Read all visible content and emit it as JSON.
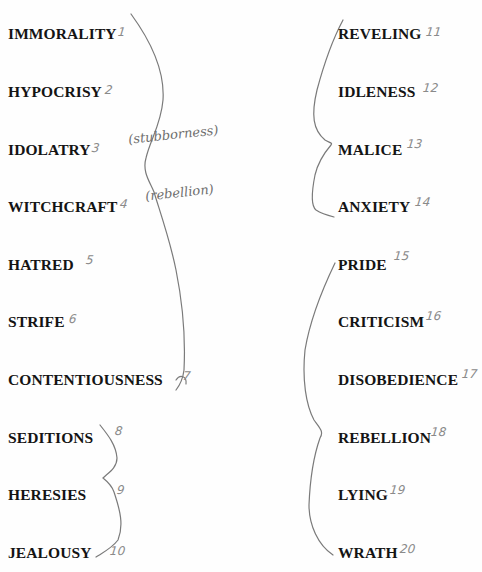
{
  "left_column": [
    {
      "word": "IMMORALITY",
      "number": "1"
    },
    {
      "word": "HYPOCRISY",
      "number": "2"
    },
    {
      "word": "IDOLATRY",
      "number": "3"
    },
    {
      "word": "WITCHCRAFT",
      "number": "4"
    },
    {
      "word": "HATRED",
      "number": "5"
    },
    {
      "word": "STRIFE",
      "number": "6"
    },
    {
      "word": "CONTENTIOUSNESS",
      "number": "7"
    },
    {
      "word": "SEDITIONS",
      "number": "8"
    },
    {
      "word": "HERESIES",
      "number": "9"
    },
    {
      "word": "JEALOUSY",
      "number": "10"
    }
  ],
  "right_column": [
    {
      "word": "REVELING",
      "number": "11"
    },
    {
      "word": "IDLENESS",
      "number": "12"
    },
    {
      "word": "MALICE",
      "number": "13"
    },
    {
      "word": "ANXIETY",
      "number": "14"
    },
    {
      "word": "PRIDE",
      "number": "15"
    },
    {
      "word": "CRITICISM",
      "number": "16"
    },
    {
      "word": "DISOBEDIENCE",
      "number": "17"
    },
    {
      "word": "REBELLION",
      "number": "18"
    },
    {
      "word": "LYING",
      "number": "19"
    },
    {
      "word": "WRATH",
      "number": "20"
    }
  ],
  "handwritten_notes": {
    "idolatry_note": "(stubborness)",
    "witchcraft_note": "(rebellion)"
  }
}
